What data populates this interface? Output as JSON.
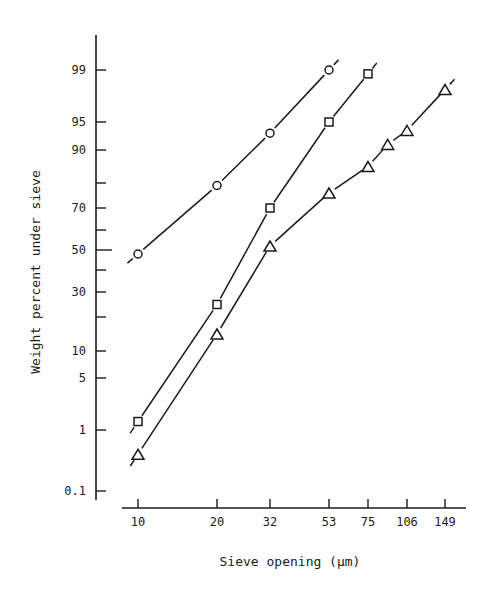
{
  "chart_data": {
    "type": "line",
    "title": "",
    "xlabel": "Sieve opening (μm)",
    "ylabel": "Weight percent under sieve",
    "x_scale": "log",
    "y_scale": "probability",
    "x_ticks": [
      10,
      20,
      32,
      53,
      75,
      106,
      149
    ],
    "x_tick_labels": [
      "10",
      "20",
      "32",
      "53",
      "75",
      "106",
      "149"
    ],
    "y_ticks_labeled": [
      0.1,
      1,
      5,
      10,
      30,
      50,
      70,
      90,
      95,
      99
    ],
    "y_tick_labels": [
      "0.1",
      "1",
      "5",
      "10",
      "30",
      "50",
      "70",
      "90",
      "95",
      "99"
    ],
    "y_ticks_minor": [
      20,
      40,
      60,
      80
    ],
    "grid": false,
    "legend": null,
    "series": [
      {
        "name": "circle",
        "marker": "circle",
        "x": [
          10,
          20,
          32,
          53
        ],
        "y": [
          48,
          79,
          93,
          99
        ]
      },
      {
        "name": "square",
        "marker": "square",
        "x": [
          10,
          20,
          32,
          53,
          75
        ],
        "y": [
          1.3,
          25,
          70,
          95,
          98.7
        ]
      },
      {
        "name": "triangle",
        "marker": "triangle",
        "x": [
          10,
          20,
          32,
          53,
          75,
          90,
          106,
          149
        ],
        "y": [
          0.4,
          15,
          52,
          76,
          85,
          91,
          93.5,
          97.5
        ]
      }
    ]
  },
  "colors": {
    "ink": "#1a1a1a",
    "background": "#ffffff"
  }
}
